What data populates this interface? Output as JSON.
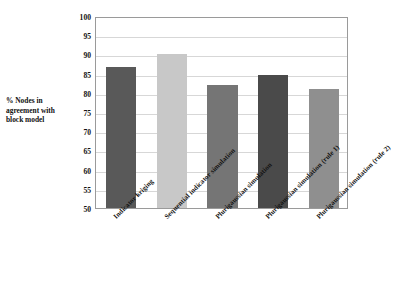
{
  "chart_data": {
    "type": "bar",
    "title": "",
    "xlabel": "",
    "ylabel": "% Nodes in agreement with block model",
    "ylabel_lines": [
      "% Nodes in",
      "agreement with",
      "block model"
    ],
    "ylim": [
      50,
      100
    ],
    "ytick_step": 5,
    "yticks": [
      50,
      55,
      60,
      65,
      70,
      75,
      80,
      85,
      90,
      95,
      100
    ],
    "ytick_labels": [
      "50",
      "55",
      "60",
      "65",
      "70",
      "75",
      "80",
      "85",
      "90",
      "95",
      "100"
    ],
    "grid": true,
    "grid_axis": "y",
    "legend": null,
    "legend_position": "none",
    "categories": [
      "Indicator kriging",
      "Sequential indicator simulation",
      "Plurigaussian simulation",
      "Plurigaussian simulation (rule 1)",
      "Plurigaussian simulation (rule 2)"
    ],
    "category_labels_rotation": -45,
    "values": [
      86.6,
      90.1,
      82.0,
      84.6,
      81.1
    ],
    "bar_colors": [
      "#595959",
      "#c8c8c8",
      "#757575",
      "#4a4a4a",
      "#8f8f8f"
    ],
    "series": [
      {
        "name": "% Nodes in agreement with block model",
        "values": [
          86.6,
          90.1,
          82.0,
          84.6,
          81.1
        ]
      }
    ],
    "bars": [
      {
        "label": "Indicator kriging",
        "value": 86.6,
        "color": "#595959"
      },
      {
        "label": "Sequential indicator simulation",
        "value": 90.1,
        "color": "#c8c8c8"
      },
      {
        "label": "Plurigaussian simulation",
        "value": 82.0,
        "color": "#757575"
      },
      {
        "label": "Plurigaussian simulation (rule 1)",
        "value": 84.6,
        "color": "#4a4a4a"
      },
      {
        "label": "Plurigaussian simulation (rule 2)",
        "value": 81.1,
        "color": "#8f8f8f"
      }
    ]
  }
}
